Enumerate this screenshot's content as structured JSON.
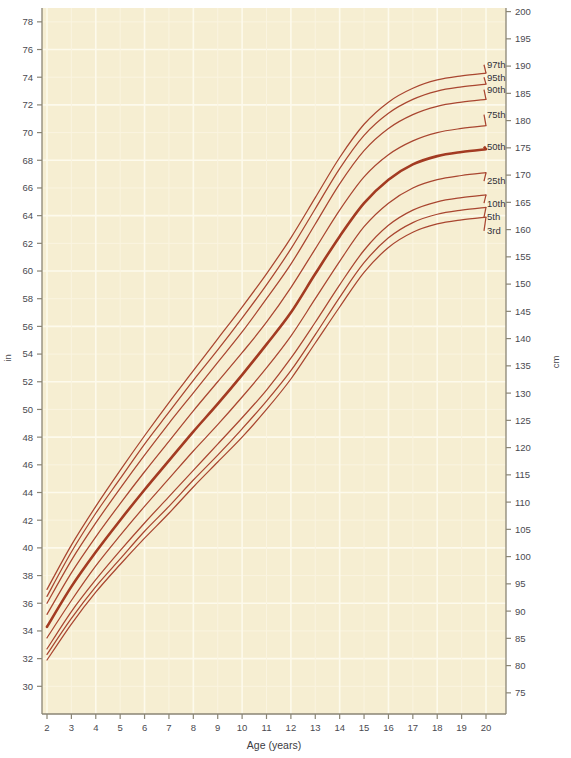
{
  "chart_data": {
    "type": "line",
    "title": "",
    "xlabel": "Age (years)",
    "ylabel": "in",
    "y2label": "cm",
    "xlim": [
      2,
      20
    ],
    "ylim": [
      28,
      79
    ],
    "y2lim": [
      71.12,
      200.66
    ],
    "grid": true,
    "legend_position": "right-inline",
    "x_ticks": [
      2,
      3,
      4,
      5,
      6,
      7,
      8,
      9,
      10,
      11,
      12,
      13,
      14,
      15,
      16,
      17,
      18,
      19,
      20
    ],
    "y_ticks_in": [
      78,
      76,
      74,
      72,
      70,
      68,
      66,
      64,
      62,
      60,
      58,
      56,
      54,
      52,
      50,
      48,
      46,
      44,
      42,
      40,
      38,
      36,
      34,
      32,
      30
    ],
    "y_ticks_cm": [
      200,
      195,
      190,
      185,
      180,
      175,
      170,
      165,
      160,
      155,
      150,
      145,
      140,
      135,
      130,
      125,
      120,
      115,
      110,
      105,
      100,
      95,
      90,
      85,
      80,
      75
    ],
    "x": [
      2,
      3,
      4,
      5,
      6,
      7,
      8,
      9,
      10,
      11,
      12,
      13,
      14,
      15,
      16,
      17,
      18,
      19,
      20
    ],
    "series": [
      {
        "name": "97th",
        "label": "97th",
        "emphasis": false,
        "label_y_in": 74.9,
        "values": [
          37.0,
          40.2,
          43.0,
          45.6,
          48.1,
          50.5,
          52.8,
          55.1,
          57.4,
          59.8,
          62.4,
          65.3,
          68.2,
          70.6,
          72.2,
          73.2,
          73.8,
          74.1,
          74.3
        ]
      },
      {
        "name": "95th",
        "label": "95th",
        "emphasis": false,
        "label_y_in": 74.0,
        "values": [
          36.5,
          39.7,
          42.5,
          45.0,
          47.5,
          49.8,
          52.1,
          54.3,
          56.6,
          59.0,
          61.6,
          64.5,
          67.4,
          69.8,
          71.4,
          72.4,
          73.0,
          73.3,
          73.5
        ]
      },
      {
        "name": "90th",
        "label": "90th",
        "emphasis": false,
        "label_y_in": 73.1,
        "values": [
          36.0,
          39.1,
          41.8,
          44.3,
          46.7,
          49.0,
          51.2,
          53.4,
          55.6,
          58.0,
          60.5,
          63.4,
          66.3,
          68.7,
          70.3,
          71.3,
          71.9,
          72.2,
          72.4
        ]
      },
      {
        "name": "75th",
        "label": "75th",
        "emphasis": false,
        "label_y_in": 71.3,
        "values": [
          35.2,
          38.2,
          40.8,
          43.2,
          45.5,
          47.7,
          49.9,
          52.0,
          54.1,
          56.3,
          58.8,
          61.6,
          64.4,
          66.8,
          68.4,
          69.4,
          70.0,
          70.3,
          70.5
        ]
      },
      {
        "name": "50th",
        "label": "50th",
        "emphasis": true,
        "label_y_in": 69.0,
        "values": [
          34.3,
          37.2,
          39.7,
          42.0,
          44.2,
          46.3,
          48.4,
          50.4,
          52.5,
          54.7,
          57.0,
          59.8,
          62.5,
          64.9,
          66.6,
          67.7,
          68.3,
          68.6,
          68.8
        ]
      },
      {
        "name": "25th",
        "label": "25th",
        "emphasis": false,
        "label_y_in": 66.5,
        "values": [
          33.5,
          36.2,
          38.7,
          40.9,
          43.0,
          45.0,
          47.0,
          48.9,
          50.9,
          53.0,
          55.3,
          58.0,
          60.7,
          63.2,
          64.9,
          66.0,
          66.6,
          66.9,
          67.1
        ]
      },
      {
        "name": "10th",
        "label": "10th",
        "emphasis": false,
        "label_y_in": 64.9,
        "values": [
          32.7,
          35.4,
          37.7,
          39.8,
          41.8,
          43.7,
          45.6,
          47.5,
          49.4,
          51.4,
          53.7,
          56.3,
          59.0,
          61.5,
          63.3,
          64.4,
          65.0,
          65.3,
          65.5
        ]
      },
      {
        "name": "5th",
        "label": "5th",
        "emphasis": false,
        "label_y_in": 63.9,
        "values": [
          32.3,
          34.9,
          37.2,
          39.2,
          41.2,
          43.0,
          44.9,
          46.7,
          48.6,
          50.6,
          52.8,
          55.4,
          58.1,
          60.6,
          62.4,
          63.5,
          64.1,
          64.4,
          64.6
        ]
      },
      {
        "name": "3rd",
        "label": "3rd",
        "emphasis": false,
        "label_y_in": 62.9,
        "values": [
          31.9,
          34.5,
          36.8,
          38.8,
          40.7,
          42.5,
          44.4,
          46.2,
          48.0,
          50.0,
          52.2,
          54.8,
          57.4,
          59.9,
          61.7,
          62.8,
          63.4,
          63.7,
          63.9
        ]
      }
    ]
  },
  "axes": {
    "left_unit": "in",
    "right_unit": "cm",
    "bottom_title": "Age (years)"
  },
  "colors": {
    "plot_background": "#f6eed2",
    "page_background": "#ffffff",
    "curve": "#a94630",
    "curve_major": "#a33b22",
    "grid": "#fdfaec",
    "axis": "#8a8575",
    "text": "#4a4a50"
  }
}
